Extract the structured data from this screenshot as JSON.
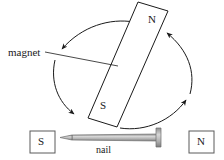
{
  "figure": {
    "labels": {
      "magnet": "magnet",
      "nail": "nail"
    },
    "magnet_poles": {
      "north": "N",
      "south": "S"
    },
    "nail_poles": {
      "left_box": "S",
      "right_box": "N"
    },
    "colors": {
      "stroke": "#1a1a1a",
      "fill": "#ffffff",
      "nail_body": "#b5b5b5",
      "nail_outline": "#6e6e6e",
      "background": "#ffffff"
    },
    "arrows": [
      {
        "name": "arc-top-left",
        "direction": "down-left"
      },
      {
        "name": "arc-left",
        "direction": "down-right"
      },
      {
        "name": "arc-right",
        "direction": "up-left"
      },
      {
        "name": "arc-bottom-right",
        "direction": "up-right"
      }
    ]
  }
}
